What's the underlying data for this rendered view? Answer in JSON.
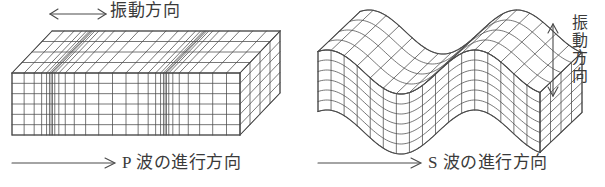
{
  "figure": {
    "background_color": "#ffffff",
    "line_color": "#4a4a4a",
    "text_color": "#3a3a3a",
    "width": 605,
    "height": 187
  },
  "p_wave": {
    "name": "P-wave block",
    "oscillation_label": "振動方向",
    "oscillation_arrow": "double-headed-horizontal",
    "direction_label": "P 波の進行方向",
    "direction_arrow": "single-headed-right",
    "description": "longitudinal wave: compressions and rarefactions along travel direction",
    "block": {
      "front_rows": 6,
      "top_depth_rows": 4,
      "columns": 30,
      "compression_zones": 2,
      "rarefaction_zones": 3
    }
  },
  "s_wave": {
    "name": "S-wave slab",
    "oscillation_label": "振動方向",
    "oscillation_arrow": "double-headed-vertical",
    "direction_label": "S 波の進行方向",
    "direction_arrow": "single-headed-right",
    "description": "transverse wave: slab displaced perpendicular to travel direction",
    "slab": {
      "front_rows": 6,
      "columns": 17,
      "depth_rows": 4,
      "wave_cycles": 1.5,
      "amplitude_px": 22
    }
  },
  "chart_data": {
    "type": "line",
    "xlabel": "進行方向",
    "ylabel": "振動方向",
    "series": [
      {
        "name": "P波 (縦波) 密度",
        "x": [
          0,
          1,
          2,
          3,
          4,
          5,
          6,
          7,
          8,
          9,
          10
        ],
        "values": [
          0.3,
          0.8,
          1.0,
          0.6,
          0.2,
          0.2,
          0.5,
          0.9,
          1.0,
          0.6,
          0.3
        ]
      },
      {
        "name": "S波 (横波) 変位",
        "x": [
          0,
          1,
          2,
          3,
          4,
          5,
          6,
          7,
          8,
          9,
          10
        ],
        "values": [
          -0.6,
          0.2,
          0.9,
          1.0,
          0.4,
          -0.5,
          -1.0,
          -0.7,
          0.1,
          0.8,
          1.0
        ]
      }
    ]
  }
}
